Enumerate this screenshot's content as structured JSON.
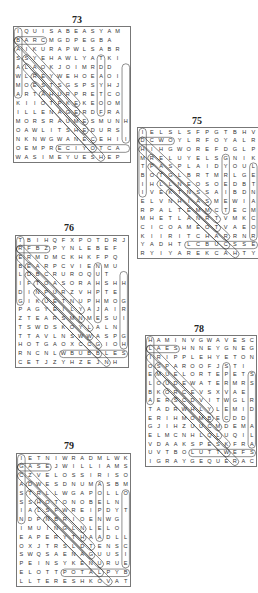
{
  "puzzles": [
    {
      "number": "73",
      "cols": 12,
      "rows": [
        "IQUISABEASYAM",
        "BARCMGDPEGBA",
        "AIKURAPWLSABR",
        "SSYEHAWLYATKI",
        "ALAOKJOIMRDD",
        "WLREYWEHOEAOI",
        "MOESTSGSPSYHJ",
        "ARTAHURPRETCO",
        "KIIOTPKEKEOOM",
        "ILLENAGERDFRA",
        "MORSRAUMESMUNH",
        "OAWLITSHEDURS",
        "NKNWGWANECEHII",
        "OEMPRECIYOTCA",
        "WASIMEYUESHEP"
      ]
    },
    {
      "number": "75",
      "cols": 12,
      "rows": [
        "IELSLSFPGTBHV",
        "DCWOYLRFOYALR",
        "HIHGWOREFDGLP",
        "MRELUYELSGNIK",
        "TPASPLAIDYOUL",
        "BOTGLBRTMRLGE",
        "IHLLNEOSOEDBT",
        "IVEKTNSSAIBDN",
        "ELVNHIASMEWIA",
        "RPALTEMMCTECM",
        "MHETLANRTVMKC",
        "CICOAMEOTVAEO",
        "KIIRITCHARRNR",
        "YADHTLCBUCSSE",
        "RYIYAREKCAHTY"
      ]
    },
    {
      "number": "76",
      "cols": 12,
      "rows": [
        "TBIHQFXPOTDRJ",
        "RFBZPYNLEBEF",
        "ERMDMCKHKFPQ",
        "BEARPCVIENMU",
        "LDBCRUROQUT",
        "IFTOASORAHSHH",
        "DINPURZVHPTE",
        "GIKUETNUPHMOG",
        "PAGYEILYAJAIR",
        "ZTEARSMNMESUI",
        "TSWDSKOYLALN",
        "TTAVLNSWWASPG",
        "HOTGAOXCCGIOH",
        "RNCNLWBUBBLES",
        "CETJZYHZEJNH"
      ]
    },
    {
      "number": "78",
      "cols": 12,
      "rows": [
        "HAMINVGWAVESC",
        "LAESHNNEYGNEG",
        "IRIPPLEHYETON",
        "OSPAROOFJSTI",
        "EMUELORTEPETS",
        "LOUDEWATERMRS",
        "BKORCEVSXVAE",
        "AERSCDVITWGLR",
        "TADRWHLYLEMID",
        "ERIHMOMBECDD",
        "GJIHZUUCMDEMA",
        "ELMCNHLQLUQIL",
        "VDAAKSPESKFRA",
        "UVTBOLUTTWEFS",
        "IGRAYGEQUERAC"
      ]
    },
    {
      "number": "79",
      "cols": 12,
      "rows": [
        "IETNIWRADMLWK",
        "GASEJWILLIAMS",
        "CZVELOSSIRISO",
        "ADWESDNUMASBM",
        "STRLLWGAPOLLO",
        "SSHOTONOBELN",
        "IALSFWREIPDYT",
        "NDPNBRIOENWG",
        "IMUINGLNLELO",
        "EAPERYTHAADLL",
        "OXJTRSLDTENSC",
        "SWQSAENAGUUSI",
        "PEINSYKENURUE",
        "ELOTTPOTALPYB",
        "LLTERESHKOVAT"
      ]
    }
  ]
}
